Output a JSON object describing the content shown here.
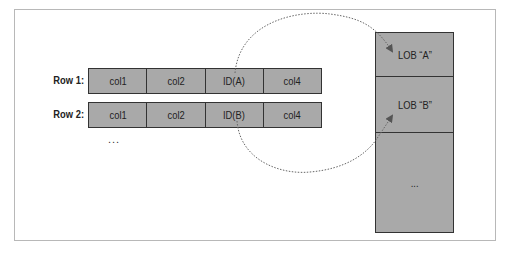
{
  "diagram": {
    "rows": [
      {
        "label": "Row 1:",
        "cells": [
          "col1",
          "col2",
          "ID(A)",
          "col4"
        ]
      },
      {
        "label": "Row 2:",
        "cells": [
          "col1",
          "col2",
          "ID(B)",
          "col4"
        ]
      }
    ],
    "rows_ellipsis": "...",
    "lob_storage": [
      {
        "label": "LOB “A”"
      },
      {
        "label": "LOB “B”"
      },
      {
        "label": "..."
      }
    ],
    "pointers": [
      {
        "from": "ID(A)",
        "to": "LOB “A”"
      },
      {
        "from": "ID(B)",
        "to": "LOB “B”"
      }
    ],
    "colors": {
      "cell_fill": "#a9a9a9",
      "border": "#333333",
      "pointer": "#555555",
      "frame": "#b8b8b8"
    }
  }
}
